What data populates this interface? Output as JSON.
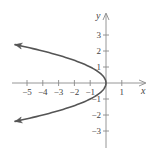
{
  "chart_data": {
    "type": "line",
    "title": "",
    "equation": "x = -y^2",
    "xlabel": "x",
    "ylabel": "y",
    "xlim": [
      -5.9,
      2.5
    ],
    "ylim": [
      -4.1,
      4.3
    ],
    "grid": false,
    "x_ticks": [
      -5,
      -4,
      -3,
      -2,
      -1,
      1
    ],
    "x_tick_labels": [
      "−5",
      "−4",
      "−3",
      "−2",
      "−1",
      "1"
    ],
    "y_ticks": [
      3,
      2,
      1,
      -1,
      -2,
      -3
    ],
    "y_tick_labels": [
      "3",
      "2",
      "1",
      "−1",
      "−2",
      "−3"
    ],
    "series": [
      {
        "name": "parabola",
        "color": "#555555",
        "arrows_at_ends": true,
        "points": [
          {
            "x": -5.76,
            "y": 2.4
          },
          {
            "x": -4.0,
            "y": 2.0
          },
          {
            "x": -2.25,
            "y": 1.5
          },
          {
            "x": -1.0,
            "y": 1.0
          },
          {
            "x": -0.25,
            "y": 0.5
          },
          {
            "x": 0.0,
            "y": 0.0
          },
          {
            "x": -0.25,
            "y": -0.5
          },
          {
            "x": -1.0,
            "y": -1.0
          },
          {
            "x": -2.25,
            "y": -1.5
          },
          {
            "x": -4.0,
            "y": -2.0
          },
          {
            "x": -5.76,
            "y": -2.4
          }
        ]
      }
    ],
    "vertex": {
      "x": 0,
      "y": 0
    }
  },
  "colors": {
    "axis": "#8a8a8a",
    "curve": "#555555",
    "text": "#444444"
  }
}
